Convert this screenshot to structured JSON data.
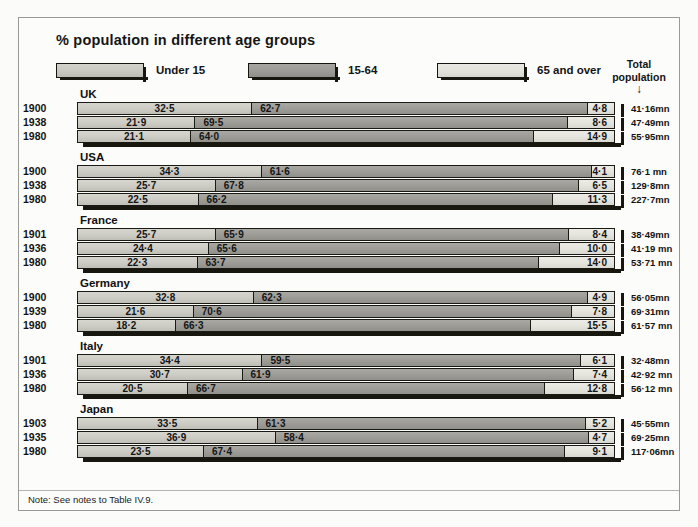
{
  "chart_title": "% population in different age groups",
  "legend": [
    {
      "label": "Under 15",
      "key": "under15",
      "color": "#cdccc5"
    },
    {
      "label": "15-64",
      "key": "age1564",
      "color": "#9d9c96"
    },
    {
      "label": "65 and over",
      "key": "age65",
      "color": "#e5e4dd"
    }
  ],
  "total_population_header": {
    "line1": "Total",
    "line2": "population",
    "arrow": "↓"
  },
  "note": "Note: See notes to Table IV.9.",
  "chart_data": {
    "type": "bar",
    "orientation": "horizontal",
    "stacked": true,
    "title": "% population in different age groups",
    "xlabel": "",
    "ylabel": "",
    "xlim": [
      0,
      100
    ],
    "grid": false,
    "legend_position": "top",
    "categories": [
      "Under 15",
      "15-64",
      "65 and over"
    ],
    "series_note": "Each bar is one country-year; segments sum to 100%.",
    "groups": [
      {
        "country": "UK",
        "rows": [
          {
            "year": "1900",
            "under15": "32·5",
            "age1564": "62·7",
            "age65": "4·8",
            "values": [
              32.5,
              62.7,
              4.8
            ],
            "total": "41·16mn"
          },
          {
            "year": "1938",
            "under15": "21·9",
            "age1564": "69·5",
            "age65": "8·6",
            "values": [
              21.9,
              69.5,
              8.6
            ],
            "total": "47·49mn"
          },
          {
            "year": "1980",
            "under15": "21·1",
            "age1564": "64·0",
            "age65": "14·9",
            "values": [
              21.1,
              64.0,
              14.9
            ],
            "total": "55·95mn"
          }
        ]
      },
      {
        "country": "USA",
        "rows": [
          {
            "year": "1900",
            "under15": "34·3",
            "age1564": "61·6",
            "age65": "4·1",
            "values": [
              34.3,
              61.6,
              4.1
            ],
            "total": "76·1 mn"
          },
          {
            "year": "1938",
            "under15": "25·7",
            "age1564": "67·8",
            "age65": "6·5",
            "values": [
              25.7,
              67.8,
              6.5
            ],
            "total": "129·8mn"
          },
          {
            "year": "1980",
            "under15": "22·5",
            "age1564": "66·2",
            "age65": "11·3",
            "values": [
              22.5,
              66.2,
              11.3
            ],
            "total": "227·7mn"
          }
        ]
      },
      {
        "country": "France",
        "rows": [
          {
            "year": "1901",
            "under15": "25·7",
            "age1564": "65·9",
            "age65": "8·4",
            "values": [
              25.7,
              65.9,
              8.4
            ],
            "total": "38·49mn"
          },
          {
            "year": "1936",
            "under15": "24·4",
            "age1564": "65·6",
            "age65": "10·0",
            "values": [
              24.4,
              65.6,
              10.0
            ],
            "total": "41·19 mn"
          },
          {
            "year": "1980",
            "under15": "22·3",
            "age1564": "63·7",
            "age65": "14·0",
            "values": [
              22.3,
              63.7,
              14.0
            ],
            "total": "53·71 mn"
          }
        ]
      },
      {
        "country": "Germany",
        "rows": [
          {
            "year": "1900",
            "under15": "32·8",
            "age1564": "62·3",
            "age65": "4·9",
            "values": [
              32.8,
              62.3,
              4.9
            ],
            "total": "56·05mn"
          },
          {
            "year": "1939",
            "under15": "21·6",
            "age1564": "70·6",
            "age65": "7·8",
            "values": [
              21.6,
              70.6,
              7.8
            ],
            "total": "69·31mn"
          },
          {
            "year": "1980",
            "under15": "18·2",
            "age1564": "66·3",
            "age65": "15·5",
            "values": [
              18.2,
              66.3,
              15.5
            ],
            "total": "61·57 mn"
          }
        ]
      },
      {
        "country": "Italy",
        "rows": [
          {
            "year": "1901",
            "under15": "34·4",
            "age1564": "59·5",
            "age65": "6·1",
            "values": [
              34.4,
              59.5,
              6.1
            ],
            "total": "32·48mn"
          },
          {
            "year": "1936",
            "under15": "30·7",
            "age1564": "61·9",
            "age65": "7·4",
            "values": [
              30.7,
              61.9,
              7.4
            ],
            "total": "42·92 mn"
          },
          {
            "year": "1980",
            "under15": "20·5",
            "age1564": "66·7",
            "age65": "12·8",
            "values": [
              20.5,
              66.7,
              12.8
            ],
            "total": "56·12 mn"
          }
        ]
      },
      {
        "country": "Japan",
        "rows": [
          {
            "year": "1903",
            "under15": "33·5",
            "age1564": "61·3",
            "age65": "5·2",
            "values": [
              33.5,
              61.3,
              5.2
            ],
            "total": "45·55mn"
          },
          {
            "year": "1935",
            "under15": "36·9",
            "age1564": "58·4",
            "age65": "4·7",
            "values": [
              36.9,
              58.4,
              4.7
            ],
            "total": "69·25mn"
          },
          {
            "year": "1980",
            "under15": "23·5",
            "age1564": "67·4",
            "age65": "9·1",
            "values": [
              23.5,
              67.4,
              9.1
            ],
            "total": "117·06mn"
          }
        ]
      }
    ]
  }
}
